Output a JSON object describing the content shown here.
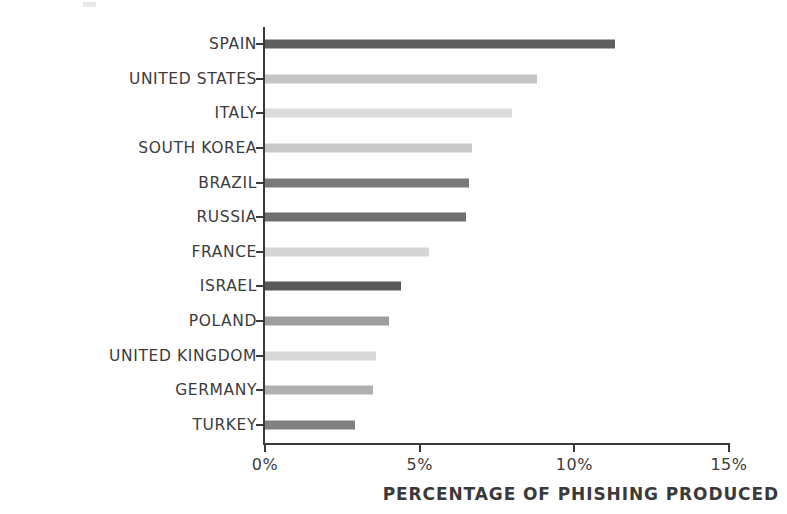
{
  "chart_data": {
    "type": "bar",
    "orientation": "horizontal",
    "title": "",
    "xlabel": "PERCENTAGE OF PHISHING PRODUCED",
    "ylabel": "",
    "xlim": [
      0,
      15
    ],
    "grid": false,
    "legend": null,
    "xticks": [
      {
        "value": 0,
        "label": "0%"
      },
      {
        "value": 5,
        "label": "5%"
      },
      {
        "value": 10,
        "label": "10%"
      },
      {
        "value": 15,
        "label": "15%"
      }
    ],
    "categories": [
      "SPAIN",
      "UNITED STATES",
      "ITALY",
      "SOUTH KOREA",
      "BRAZIL",
      "RUSSIA",
      "FRANCE",
      "ISRAEL",
      "POLAND",
      "UNITED KINGDOM",
      "GERMANY",
      "TURKEY"
    ],
    "values": [
      11.3,
      8.8,
      8.0,
      6.7,
      6.6,
      6.5,
      5.3,
      4.4,
      4.0,
      3.6,
      3.5,
      2.9
    ],
    "bars": [
      {
        "label": "SPAIN",
        "value": 11.3,
        "color": "#5f5f5f"
      },
      {
        "label": "UNITED STATES",
        "value": 8.8,
        "color": "#c4c4c4"
      },
      {
        "label": "ITALY",
        "value": 8.0,
        "color": "#dcdcdc"
      },
      {
        "label": "SOUTH KOREA",
        "value": 6.7,
        "color": "#c9c9c9"
      },
      {
        "label": "BRAZIL",
        "value": 6.6,
        "color": "#7a7a7a"
      },
      {
        "label": "RUSSIA",
        "value": 6.5,
        "color": "#6f6f6f"
      },
      {
        "label": "FRANCE",
        "value": 5.3,
        "color": "#d5d5d5"
      },
      {
        "label": "ISRAEL",
        "value": 4.4,
        "color": "#595959"
      },
      {
        "label": "POLAND",
        "value": 4.0,
        "color": "#9e9e9e"
      },
      {
        "label": "UNITED KINGDOM",
        "value": 3.6,
        "color": "#d8d8d8"
      },
      {
        "label": "GERMANY",
        "value": 3.5,
        "color": "#b0b0b0"
      },
      {
        "label": "TURKEY",
        "value": 2.9,
        "color": "#808080"
      }
    ]
  },
  "axis": {
    "axis_color": "#3a3a3a",
    "text_color": "#3c3c3c"
  }
}
